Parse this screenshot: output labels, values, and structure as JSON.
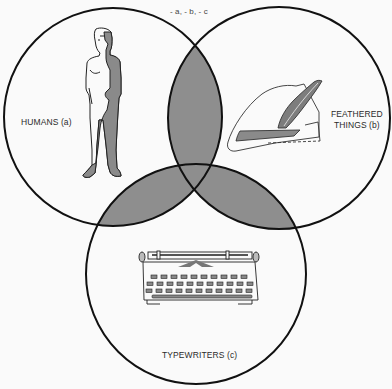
{
  "diagram": {
    "type": "venn-3",
    "top_annotation": "- a, - b, - c",
    "sets": [
      {
        "id": "a",
        "label": "HUMANS (a)",
        "illustration": "standing-human-figure"
      },
      {
        "id": "b",
        "label_line1": "FEATHERED",
        "label_line2": "THINGS (b)",
        "illustration": "feathered-hat"
      },
      {
        "id": "c",
        "label": "TYPEWRITERS (c)",
        "illustration": "typewriter"
      }
    ],
    "shaded_regions": [
      "a∩b",
      "a∩c",
      "b∩c",
      "a∩b∩c"
    ],
    "colors": {
      "background": "#fafafa",
      "outline": "#111111",
      "shading": "#8e8e8e"
    }
  }
}
